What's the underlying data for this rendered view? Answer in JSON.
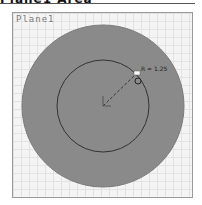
{
  "header": {
    "title": "Plane1 Area"
  },
  "viewport": {
    "plane_label": "Plane1",
    "dimension_label": "R = 1.25"
  },
  "colors": {
    "outer_disc": "#8a8a8a",
    "inner_circle_stroke": "#333333",
    "grid_bg": "#f4f4f4"
  }
}
